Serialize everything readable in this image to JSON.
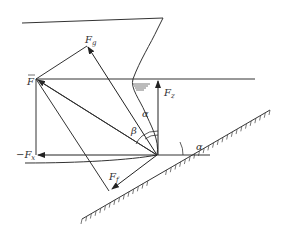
{
  "diagram": {
    "type": "force-vector-diagram",
    "labels": {
      "F_bar": "F",
      "F_g": "F",
      "F_g_sub": "g",
      "F_s": "F",
      "F_s_sub": "z",
      "neg_F_x": "−F",
      "neg_F_x_sub": "x",
      "F_f": "F",
      "F_f_sub": "f",
      "alpha_1": "α",
      "alpha_2": "α",
      "beta": "β"
    },
    "colors": {
      "line": "#333333",
      "background": "#ffffff"
    }
  }
}
